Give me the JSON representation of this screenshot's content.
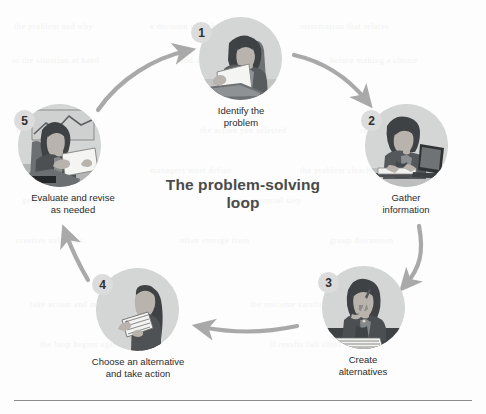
{
  "diagram": {
    "title": "The problem-solving\nloop",
    "type": "cycle",
    "accent_color": "#a8a8a8",
    "circle_fill": "#d4d5d5",
    "badge_fill": "#dcdcdc",
    "text_color": "#2b2b2b",
    "title_color": "#4a4a4a",
    "steps": [
      {
        "number": "1",
        "label": "Identify the\nproblem",
        "image_name": "woman-reading-document-at-desk"
      },
      {
        "number": "2",
        "label": "Gather\ninformation",
        "image_name": "woman-working-on-laptop"
      },
      {
        "number": "3",
        "label": "Create\nalternatives",
        "image_name": "woman-thinking-with-pen"
      },
      {
        "number": "4",
        "label": "Choose an alternative\nand take action",
        "image_name": "woman-holding-checklist"
      },
      {
        "number": "5",
        "label": "Evaluate and revise\nas needed",
        "image_name": "woman-reviewing-paper-with-chart"
      }
    ],
    "arrows": [
      {
        "from": "5",
        "to": "1",
        "name": "arrow-5-to-1"
      },
      {
        "from": "1",
        "to": "2",
        "name": "arrow-1-to-2"
      },
      {
        "from": "2",
        "to": "3",
        "name": "arrow-2-to-3"
      },
      {
        "from": "3",
        "to": "4",
        "name": "arrow-3-to-4"
      },
      {
        "from": "4",
        "to": "5",
        "name": "arrow-4-to-5"
      }
    ]
  },
  "ghost_text": [
    {
      "t": "the problem and why",
      "x": 14,
      "y": 22
    },
    {
      "t": "a decision must be made",
      "x": 150,
      "y": 22
    },
    {
      "t": "information that relates",
      "x": 300,
      "y": 22
    },
    {
      "t": "to the situation at hand",
      "x": 12,
      "y": 56
    },
    {
      "t": "and consider each one",
      "x": 180,
      "y": 56
    },
    {
      "t": "before making a choice",
      "x": 330,
      "y": 56
    },
    {
      "t": "evaluate the results of",
      "x": 16,
      "y": 126
    },
    {
      "t": "the action you selected",
      "x": 200,
      "y": 126
    },
    {
      "t": "revise as needed",
      "x": 360,
      "y": 126
    },
    {
      "t": "managers must define",
      "x": 150,
      "y": 166
    },
    {
      "t": "the problem clearly",
      "x": 300,
      "y": 166
    },
    {
      "t": "gathering relevant data",
      "x": 22,
      "y": 196
    },
    {
      "t": "is an essential step",
      "x": 230,
      "y": 196
    },
    {
      "t": "creative solutions",
      "x": 16,
      "y": 236
    },
    {
      "t": "often emerge from",
      "x": 180,
      "y": 236
    },
    {
      "t": "group discussion",
      "x": 330,
      "y": 236
    },
    {
      "t": "take action and monitor",
      "x": 30,
      "y": 300
    },
    {
      "t": "the outcome carefully",
      "x": 250,
      "y": 300
    },
    {
      "t": "the loop begins again",
      "x": 40,
      "y": 340
    },
    {
      "t": "if results fall short",
      "x": 270,
      "y": 340
    }
  ]
}
